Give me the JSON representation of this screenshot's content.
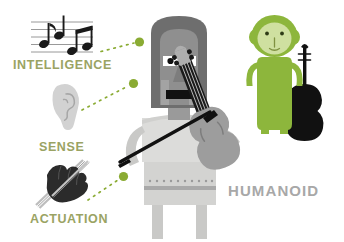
{
  "illustration": {
    "title": "Humanoid robot violin illustration",
    "background_color": "#ffffff"
  },
  "labels": {
    "intelligence": "INTELLIGENCE",
    "sense": "SENSE",
    "actuation": "ACTUATION",
    "humanoid": "HUMANOID"
  },
  "colors": {
    "label_green": "#9aa363",
    "dot_green": "#8aab33",
    "humanoid_gray": "#a8a8a8",
    "robot_helmet": "#6e6e6e",
    "robot_face": "#8f8f8f",
    "robot_body": "#d8d8d6",
    "robot_arm": "#c9c9c7",
    "violin_gray": "#9d9d9d",
    "monkey_green": "#8db63c",
    "monkey_face": "#cfe0a0",
    "violin_black": "#111111",
    "staff_gray": "#8a8a8a",
    "ear_gray": "#cfcfcf",
    "glove_black": "#2b2b2b"
  },
  "icons": {
    "music_notes": "music-notes-icon",
    "ear": "ear-icon",
    "gloved_hand": "gloved-hand-icon",
    "robot": "humanoid-robot-figure",
    "monkey": "green-monkey-figure",
    "violin_black": "black-violin",
    "violin_gray": "gray-violin",
    "bow": "violin-bow"
  },
  "connectors": [
    {
      "name": "connector-intelligence",
      "from": "music-notes-icon",
      "to": "robot-head"
    },
    {
      "name": "connector-sense",
      "from": "ear-icon",
      "to": "robot-head-lower"
    },
    {
      "name": "connector-actuation",
      "from": "gloved-hand-icon",
      "to": "robot-arm"
    }
  ]
}
